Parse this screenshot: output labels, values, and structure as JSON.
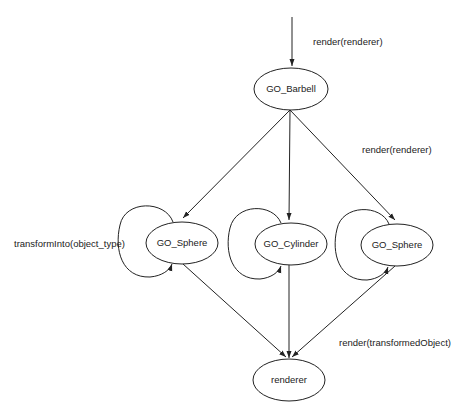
{
  "diagram": {
    "type": "state-collaboration-diagram",
    "nodes": [
      {
        "id": "barbell",
        "label": "GO_Barbell"
      },
      {
        "id": "sphere_left",
        "label": "GO_Sphere"
      },
      {
        "id": "cylinder",
        "label": "GO_Cylinder"
      },
      {
        "id": "sphere_right",
        "label": "GO_Sphere"
      },
      {
        "id": "renderer",
        "label": "renderer"
      }
    ],
    "edge_labels": {
      "entry": "render(renderer)",
      "to_children": "render(renderer)",
      "self_loop": "transformInto(object_type)",
      "to_renderer": "render(transformedObject)"
    },
    "edges": [
      {
        "from": "entry",
        "to": "barbell",
        "label": "render(renderer)"
      },
      {
        "from": "barbell",
        "to": "sphere_left"
      },
      {
        "from": "barbell",
        "to": "cylinder"
      },
      {
        "from": "barbell",
        "to": "sphere_right",
        "label": "render(renderer)"
      },
      {
        "from": "sphere_left",
        "to": "sphere_left",
        "label": "transformInto(object_type)"
      },
      {
        "from": "cylinder",
        "to": "cylinder"
      },
      {
        "from": "sphere_right",
        "to": "sphere_right"
      },
      {
        "from": "sphere_left",
        "to": "renderer"
      },
      {
        "from": "cylinder",
        "to": "renderer"
      },
      {
        "from": "sphere_right",
        "to": "renderer",
        "label": "render(transformedObject)"
      }
    ],
    "colors": {
      "stroke": "#222222",
      "background": "#ffffff"
    }
  }
}
